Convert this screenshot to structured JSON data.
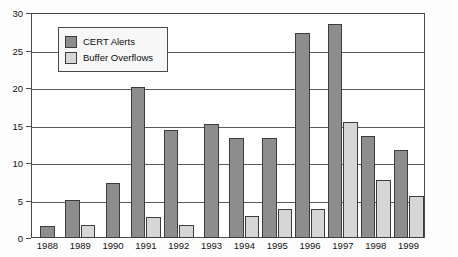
{
  "chart_data": {
    "type": "bar",
    "title": "",
    "xlabel": "",
    "ylabel": "",
    "ylim": [
      0,
      30
    ],
    "yticks": [
      0,
      5,
      10,
      15,
      20,
      25,
      30
    ],
    "grid": true,
    "legend_position": "top-left",
    "categories": [
      "1988",
      "1989",
      "1990",
      "1991",
      "1992",
      "1993",
      "1994",
      "1995",
      "1996",
      "1997",
      "1998",
      "1999"
    ],
    "series": [
      {
        "name": "CERT Alerts",
        "color": "#8d8d8d",
        "values": [
          1.6,
          5.1,
          7.3,
          20.2,
          14.4,
          15.2,
          13.4,
          13.4,
          27.3,
          28.6,
          13.6,
          11.7
        ]
      },
      {
        "name": "Buffer Overflows",
        "color": "#d6d6d6",
        "values": [
          0,
          1.7,
          0,
          2.8,
          1.8,
          0,
          2.9,
          3.9,
          3.9,
          15.5,
          7.8,
          5.6
        ]
      }
    ]
  },
  "legend": {
    "items": [
      {
        "label": "CERT Alerts",
        "swatch": "cert"
      },
      {
        "label": "Buffer Overflows",
        "swatch": "bof"
      }
    ]
  },
  "axis": {
    "y_tick_labels": [
      "0",
      "5",
      "10",
      "15",
      "20",
      "25",
      "30"
    ],
    "x_tick_labels": [
      "1988",
      "1989",
      "1990",
      "1991",
      "1992",
      "1993",
      "1994",
      "1995",
      "1996",
      "1997",
      "1998",
      "1999"
    ]
  },
  "colors": {
    "cert_alerts": "#8d8d8d",
    "buffer_overflows": "#d6d6d6",
    "frame": "#4a4a4a",
    "gridline": "#5a5a5a",
    "background": "#ffffff"
  }
}
